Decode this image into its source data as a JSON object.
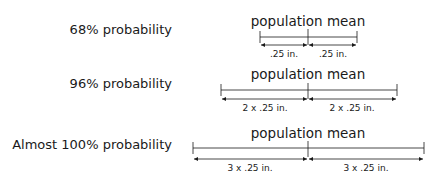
{
  "rows": [
    {
      "probability_label": "68% probability",
      "title": "population mean",
      "left_dim": ".25 in.",
      "right_dim": ".25 in."
    },
    {
      "probability_label": "96% probability",
      "title": "population mean",
      "left_dim": "2 x .25 in.",
      "right_dim": "2 x .25 in."
    },
    {
      "probability_label": "Almost 100% probability",
      "title": "population mean",
      "left_dim": "3 x .25 in.",
      "right_dim": "3 x .25 in."
    }
  ],
  "colors": {
    "line": "#1a1a1a",
    "background": "#ffffff"
  }
}
